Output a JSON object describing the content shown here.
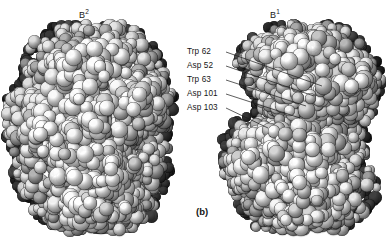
{
  "figure": {
    "panel_label": "(b)",
    "background_color": "#ffffff",
    "text_color": "#161616"
  },
  "views": [
    {
      "id": "left",
      "base_label": "B",
      "superscript": "2",
      "full_label": "B2"
    },
    {
      "id": "right",
      "base_label": "B",
      "superscript": "1",
      "full_label": "B1"
    }
  ],
  "annotations": [
    {
      "label": "Trp 62",
      "residue": "Trp",
      "number": "62",
      "x": 187,
      "y": 48,
      "line_end_x": 322,
      "line_end_y": 86
    },
    {
      "label": "Asp 52",
      "residue": "Asp",
      "number": "52",
      "x": 187,
      "y": 62,
      "line_end_x": 314,
      "line_end_y": 96
    },
    {
      "label": "Trp 63",
      "residue": "Trp",
      "number": "63",
      "x": 187,
      "y": 76,
      "line_end_x": 306,
      "line_end_y": 106
    },
    {
      "label": "Asp 101",
      "residue": "Asp",
      "number": "101",
      "x": 187,
      "y": 90,
      "line_end_x": 300,
      "line_end_y": 118
    },
    {
      "label": "Asp 103",
      "residue": "Asp",
      "number": "103",
      "x": 187,
      "y": 104,
      "line_end_x": 268,
      "line_end_y": 128
    }
  ],
  "molecule_style": {
    "rendering": "space-filling-cpk-grayscale",
    "highlight_color": "#ffffff",
    "midtone_color": "#9a9a9a",
    "shadow_color": "#111111",
    "outline_color": "#000000"
  }
}
